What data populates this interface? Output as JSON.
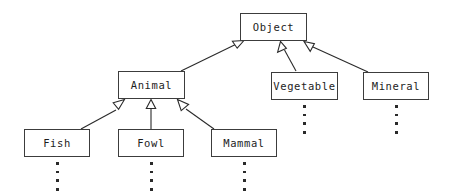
{
  "diagram": {
    "type": "class-hierarchy",
    "background_color": "#ffffff",
    "box_border_color": "#3c3c3c",
    "line_color": "#2a2a2a",
    "text_color": "#1d1d1d",
    "arrowhead_style": "hollow-triangle",
    "nodes": [
      {
        "id": "object",
        "label": "Object",
        "x": 240,
        "y": 13,
        "w": 67,
        "h": 28,
        "ellipsis_dots": 0
      },
      {
        "id": "animal",
        "label": "Animal",
        "x": 118,
        "y": 71,
        "w": 67,
        "h": 28,
        "ellipsis_dots": 0
      },
      {
        "id": "vegetable",
        "label": "Vegetable",
        "x": 271,
        "y": 72,
        "w": 67,
        "h": 28,
        "ellipsis_dots": 4
      },
      {
        "id": "mineral",
        "label": "Mineral",
        "x": 363,
        "y": 72,
        "w": 66,
        "h": 28,
        "ellipsis_dots": 4
      },
      {
        "id": "fish",
        "label": "Fish",
        "x": 24,
        "y": 129,
        "w": 66,
        "h": 28,
        "ellipsis_dots": 4
      },
      {
        "id": "fowl",
        "label": "Fowl",
        "x": 118,
        "y": 129,
        "w": 66,
        "h": 28,
        "ellipsis_dots": 4
      },
      {
        "id": "mammal",
        "label": "Mammal",
        "x": 211,
        "y": 129,
        "w": 66,
        "h": 28,
        "ellipsis_dots": 4
      }
    ],
    "edges": [
      {
        "id": "animal-to-object",
        "from": "animal",
        "to": "object",
        "relation": "generalization"
      },
      {
        "id": "vegetable-to-object",
        "from": "vegetable",
        "to": "object",
        "relation": "generalization"
      },
      {
        "id": "mineral-to-object",
        "from": "mineral",
        "to": "object",
        "relation": "generalization"
      },
      {
        "id": "fish-to-animal",
        "from": "fish",
        "to": "animal",
        "relation": "generalization"
      },
      {
        "id": "fowl-to-animal",
        "from": "fowl",
        "to": "animal",
        "relation": "generalization"
      },
      {
        "id": "mammal-to-animal",
        "from": "mammal",
        "to": "animal",
        "relation": "generalization"
      }
    ]
  }
}
